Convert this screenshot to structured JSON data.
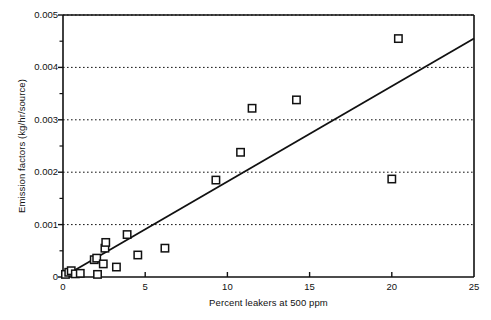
{
  "chart_data": {
    "type": "scatter",
    "title": "",
    "xlabel": "Percent leakers at 500 ppm",
    "ylabel": "Emission factors (kg/hr/source)",
    "xlim": [
      0,
      25
    ],
    "ylim": [
      0,
      0.005
    ],
    "xticks": [
      0,
      5,
      10,
      15,
      20,
      25
    ],
    "xtick_labels": [
      "0",
      "5",
      "10",
      "15",
      "20",
      "25"
    ],
    "yticks": [
      0,
      0.001,
      0.002,
      0.003,
      0.004,
      0.005
    ],
    "ytick_labels": [
      "0",
      "0.001",
      "0.002",
      "0.003",
      "0.004",
      "0.005"
    ],
    "yminor_ticks": [
      0.0005,
      0.0015,
      0.0025,
      0.0035,
      0.0045
    ],
    "grid": "horizontal-dotted-at-major-y",
    "legend": null,
    "marker": "open-square",
    "marker_color": "#111111",
    "line_color": "#111111",
    "points": [
      {
        "x": 0.15,
        "y": 5e-05
      },
      {
        "x": 0.35,
        "y": 9e-05
      },
      {
        "x": 0.5,
        "y": 0.00012
      },
      {
        "x": 0.75,
        "y": 6e-05
      },
      {
        "x": 1.05,
        "y": 7e-05
      },
      {
        "x": 1.9,
        "y": 0.00033
      },
      {
        "x": 2.05,
        "y": 0.00036
      },
      {
        "x": 2.1,
        "y": 5e-05
      },
      {
        "x": 2.45,
        "y": 0.00025
      },
      {
        "x": 2.55,
        "y": 0.00055
      },
      {
        "x": 2.6,
        "y": 0.00066
      },
      {
        "x": 3.25,
        "y": 0.00019
      },
      {
        "x": 3.9,
        "y": 0.00081
      },
      {
        "x": 4.55,
        "y": 0.00042
      },
      {
        "x": 6.2,
        "y": 0.00055
      },
      {
        "x": 9.3,
        "y": 0.00185
      },
      {
        "x": 10.8,
        "y": 0.00238
      },
      {
        "x": 11.5,
        "y": 0.00322
      },
      {
        "x": 14.2,
        "y": 0.00338
      },
      {
        "x": 20.0,
        "y": 0.00187
      },
      {
        "x": 20.4,
        "y": 0.00455
      }
    ],
    "fit_line": {
      "type": "linear",
      "x_start": 0.0,
      "y_start": 0.0,
      "x_end": 25.0,
      "y_end": 0.00455
    }
  },
  "axes": {
    "plot_left_px": 63,
    "plot_right_px": 474,
    "plot_top_px": 15,
    "plot_bottom_px": 277
  }
}
